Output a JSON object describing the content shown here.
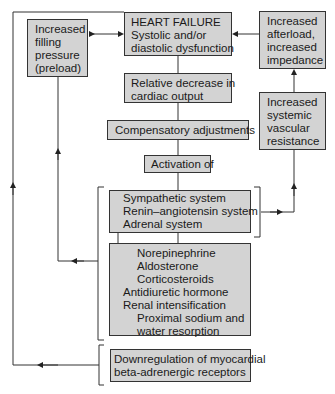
{
  "diagram": {
    "nodes": {
      "heart_failure": {
        "lines": [
          "HEART FAILURE",
          "Systolic and/or",
          "diastolic dysfunction"
        ]
      },
      "preload": {
        "lines": [
          "Increased",
          "filling",
          "pressure",
          "(preload)"
        ]
      },
      "afterload": {
        "lines": [
          "Increased",
          "afterload,",
          "increased",
          "impedance"
        ]
      },
      "cardiac_output": {
        "lines": [
          "Relative decrease in",
          "cardiac output"
        ]
      },
      "compensatory": {
        "lines": [
          "Compensatory adjustments"
        ]
      },
      "systemic_resistance": {
        "lines": [
          "Increased",
          "systemic",
          "vascular",
          "resistance"
        ]
      },
      "activation": {
        "lines": [
          "Activation of"
        ]
      },
      "systems": {
        "lines": [
          "Sympathetic system",
          "Renin–angiotensin system",
          "Adrenal system"
        ]
      },
      "hormones": {
        "lines": [
          "Norepinephrine",
          "Aldosterone",
          "Corticosteroids",
          "Antidiuretic hormone",
          "Renal intensification",
          "Proximal sodium and",
          "water resorption"
        ]
      },
      "downregulation": {
        "lines": [
          "Downregulation of myocardial",
          "beta-adrenergic receptors"
        ]
      }
    },
    "colors": {
      "box_fill": "#d3d3d3",
      "line": "#333333"
    }
  }
}
